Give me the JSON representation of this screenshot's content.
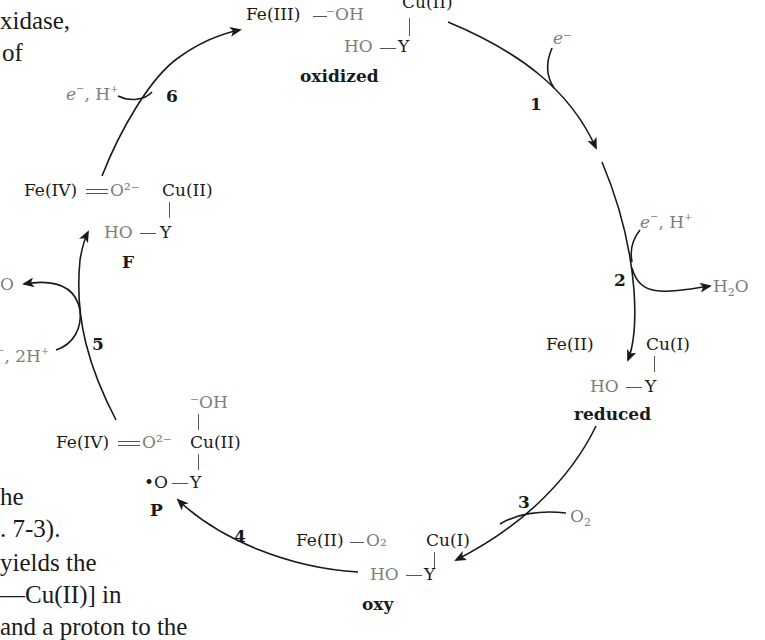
{
  "figure": {
    "states": {
      "oxidized": {
        "label": "oxidized",
        "fe": "Fe(III)",
        "fe_ligand": "⁻OH",
        "cu": "Cu(II)",
        "tyr": "HO",
        "y": "Y"
      },
      "reduced": {
        "label": "reduced",
        "fe": "Fe(II)",
        "cu": "Cu(I)",
        "tyr": "HO",
        "y": "Y"
      },
      "oxy": {
        "label": "oxy",
        "fe": "Fe(II)",
        "fe_ligand": "O₂",
        "cu": "Cu(I)",
        "tyr": "HO",
        "y": "Y"
      },
      "P": {
        "label": "P",
        "fe": "Fe(IV)",
        "fe_ligand": "O²⁻",
        "cu": "Cu(II)",
        "cu_ligand": "⁻OH",
        "tyr": "•O",
        "y": "Y"
      },
      "F": {
        "label": "F",
        "fe": "Fe(IV)",
        "fe_ligand": "O²⁻",
        "cu": "Cu(II)",
        "tyr": "HO",
        "y": "Y"
      }
    },
    "steps": [
      {
        "num": "1",
        "input": "e⁻",
        "output": ""
      },
      {
        "num": "2",
        "input": "e⁻, H⁺",
        "output": "H₂O"
      },
      {
        "num": "3",
        "input": "O₂",
        "output": ""
      },
      {
        "num": "4",
        "input": "",
        "output": ""
      },
      {
        "num": "5",
        "input": "e⁻, 2H⁺",
        "output": "H₂O"
      },
      {
        "num": "6",
        "input": "e⁻, H⁺",
        "output": ""
      }
    ],
    "labels": {
      "step2_in_e": "e",
      "step2_in_rest": ", H",
      "step6_in_e": "e",
      "step6_in_rest": ", H",
      "step5_in_rest": ", 2H",
      "step5_out": "O",
      "h2o_H": "H",
      "h2o_2": "2",
      "h2o_O": "O",
      "o2_O": "O",
      "o2_2": "2"
    }
  },
  "body_text": {
    "lines": [
      "xidase,",
      "of",
      "he",
      ". 7-3).",
      "yields the",
      "—Cu(II)]  in",
      "and a proton to the"
    ]
  }
}
